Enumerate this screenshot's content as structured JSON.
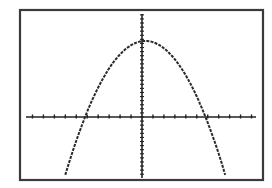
{
  "chart_data": {
    "type": "line",
    "title": "",
    "xlabel": "",
    "ylabel": "",
    "xlim": [
      -10.5,
      10.5
    ],
    "ylim": [
      -12,
      14
    ],
    "x_tick_step": 1,
    "y_tick_step": 1,
    "grid": false,
    "legend": null,
    "series": [
      {
        "name": "parabola",
        "x": [
          -7,
          -6,
          -5.2,
          -4,
          -3,
          -2,
          -1,
          0,
          0.3,
          1,
          2,
          3,
          4,
          5,
          5.8,
          7,
          7.6
        ],
        "y": [
          -11.5,
          -5.8,
          0,
          5.9,
          10.3,
          13.9,
          16.6,
          18.3,
          18.6,
          18.2,
          16.6,
          13.9,
          10.1,
          5.1,
          0,
          -8.5,
          -12.0
        ]
      }
    ],
    "roots_approx": [
      -5.2,
      5.8
    ],
    "vertex_approx": [
      0.3,
      18.6
    ]
  },
  "colors": {
    "background": "#ffffff",
    "frame": "#3a3a3a",
    "axes": "#222222",
    "curve": "#2a2a2a"
  }
}
